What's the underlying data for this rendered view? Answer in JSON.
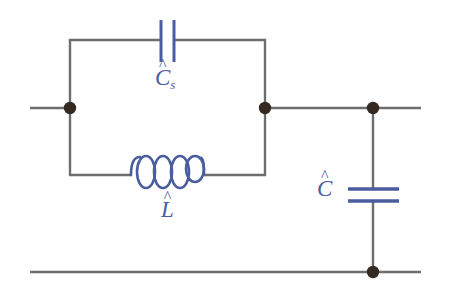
{
  "diagram": {
    "type": "electrical-schematic",
    "canvas": {
      "width": 451,
      "height": 296,
      "background": "#ffffff"
    },
    "colors": {
      "wire": "#6e6e6e",
      "component": "#4a5d9e",
      "node": "#352a22",
      "label": "#4a5d9e",
      "background": "#ffffff"
    },
    "labels": {
      "series_capacitor": {
        "base": "C",
        "accent": "^",
        "subscript": "s"
      },
      "inductor": {
        "base": "L",
        "accent": "^",
        "subscript": ""
      },
      "shunt_capacitor": {
        "base": "C",
        "accent": "^",
        "subscript": ""
      }
    },
    "components": [
      {
        "name": "series-capacitor",
        "symbol": "capacitor",
        "orientation": "horizontal",
        "label": "Ĉs",
        "plates": 2,
        "position": {
          "x": 167,
          "y": 41
        }
      },
      {
        "name": "inductor",
        "symbol": "inductor-coil",
        "orientation": "horizontal",
        "label": "L̂",
        "loops": 4,
        "position": {
          "x": 167,
          "y": 175
        }
      },
      {
        "name": "shunt-capacitor",
        "symbol": "capacitor",
        "orientation": "vertical",
        "label": "Ĉ",
        "plates": 2,
        "position": {
          "x": 373,
          "y": 195
        }
      }
    ],
    "nodes": [
      {
        "name": "node-input-left",
        "x": 70,
        "y": 108,
        "radius": 6
      },
      {
        "name": "node-tank-right",
        "x": 265,
        "y": 108,
        "radius": 6
      },
      {
        "name": "node-shunt-top",
        "x": 373,
        "y": 108,
        "radius": 6
      },
      {
        "name": "node-shunt-bottom",
        "x": 373,
        "y": 272,
        "radius": 6
      }
    ],
    "wires": [
      {
        "name": "wire-input-terminal",
        "from": [
          30,
          108
        ],
        "to": [
          70,
          108
        ]
      },
      {
        "name": "wire-top-rail-right",
        "from": [
          265,
          108
        ],
        "to": [
          420,
          108
        ]
      },
      {
        "name": "wire-bottom-rail",
        "from": [
          30,
          272
        ],
        "to": [
          420,
          272
        ]
      },
      {
        "name": "wire-tank-left-riser",
        "from": [
          70,
          40
        ],
        "to": [
          70,
          175
        ]
      },
      {
        "name": "wire-tank-right-riser",
        "from": [
          265,
          40
        ],
        "to": [
          265,
          175
        ]
      },
      {
        "name": "wire-tank-top-left",
        "from": [
          70,
          40
        ],
        "to": [
          161,
          40
        ]
      },
      {
        "name": "wire-tank-top-right",
        "from": [
          174,
          40
        ],
        "to": [
          265,
          40
        ]
      },
      {
        "name": "wire-tank-bottom-left",
        "from": [
          70,
          175
        ],
        "to": [
          131,
          175
        ]
      },
      {
        "name": "wire-tank-bottom-right",
        "from": [
          203,
          175
        ],
        "to": [
          265,
          175
        ]
      },
      {
        "name": "wire-shunt-branch-top",
        "from": [
          373,
          108
        ],
        "to": [
          373,
          189
        ]
      },
      {
        "name": "wire-shunt-branch-bottom",
        "from": [
          373,
          201
        ],
        "to": [
          373,
          272
        ]
      }
    ]
  }
}
